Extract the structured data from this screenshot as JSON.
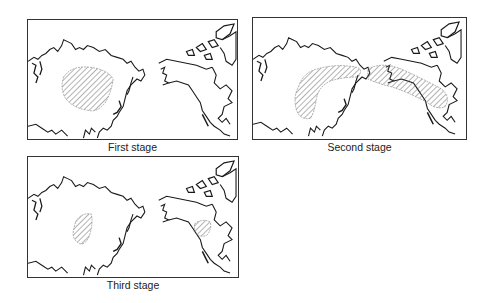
{
  "figure": {
    "panels": [
      {
        "caption": "First stage",
        "regions": [
          "east-asia-interior"
        ]
      },
      {
        "caption": "Second stage",
        "regions": [
          "east-asia-siberia-arc",
          "alaska-canada-belt"
        ]
      },
      {
        "caption": "Third stage",
        "regions": [
          "east-asia-coastal",
          "eastern-north-america"
        ]
      }
    ],
    "colors": {
      "coastline": "#1a1a1a",
      "hatch": "#555555",
      "frame": "#333333",
      "background": "#ffffff"
    }
  }
}
